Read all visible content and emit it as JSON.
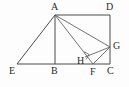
{
  "figure": {
    "background_color": "#fdfdfd",
    "line_color": "#4a4a4a",
    "label_color": "#2b2b2b",
    "labels": [
      {
        "id": "A",
        "text": "A",
        "x": 51,
        "y": 2
      },
      {
        "id": "D",
        "text": "D",
        "x": 106,
        "y": 2
      },
      {
        "id": "G",
        "text": "G",
        "x": 113,
        "y": 41
      },
      {
        "id": "H",
        "text": "H",
        "x": 77,
        "y": 56
      },
      {
        "id": "E",
        "text": "E",
        "x": 9,
        "y": 66
      },
      {
        "id": "B",
        "text": "B",
        "x": 51,
        "y": 66
      },
      {
        "id": "F",
        "text": "F",
        "x": 90,
        "y": 67
      },
      {
        "id": "C",
        "text": "C",
        "x": 107,
        "y": 66
      }
    ],
    "points": {
      "A": {
        "x": 55,
        "y": 15
      },
      "B": {
        "x": 55,
        "y": 64
      },
      "C": {
        "x": 110,
        "y": 64
      },
      "D": {
        "x": 110,
        "y": 15
      },
      "E": {
        "x": 17,
        "y": 64
      },
      "F": {
        "x": 93,
        "y": 64
      },
      "G": {
        "x": 110,
        "y": 47
      },
      "H": {
        "x": 85,
        "y": 57
      }
    },
    "segments": [
      {
        "name": "AD",
        "from": "A",
        "to": "D"
      },
      {
        "name": "DC",
        "from": "D",
        "to": "C"
      },
      {
        "name": "EC",
        "from": "E",
        "to": "C"
      },
      {
        "name": "AB",
        "from": "A",
        "to": "B"
      },
      {
        "name": "AE",
        "from": "A",
        "to": "E"
      },
      {
        "name": "AF",
        "from": "A",
        "to": "F"
      },
      {
        "name": "AG",
        "from": "A",
        "to": "G"
      },
      {
        "name": "FG",
        "from": "F",
        "to": "G"
      },
      {
        "name": "HG",
        "from": "H",
        "to": "G"
      }
    ],
    "right_angle_marks": [
      {
        "at": "H",
        "on_segments": "AG-FH"
      }
    ]
  }
}
